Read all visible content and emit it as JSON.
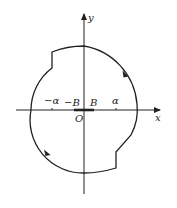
{
  "diagram": {
    "type": "contour-plot",
    "axes": {
      "x_label": "x",
      "y_label": "y",
      "origin_label": "O"
    },
    "tick_labels": {
      "neg_alpha": "−α",
      "neg_B": "−B",
      "pos_B": "B",
      "pos_alpha": "α"
    },
    "contour": {
      "shape": "closed circular contour with two step notches",
      "direction": "clockwise",
      "notches": [
        "top-left step at x = −α",
        "bottom-right step at x = α"
      ]
    },
    "segment": {
      "description": "thick segment on x-axis from −B to B"
    },
    "colors": {
      "stroke": "#222222",
      "background": "#ffffff"
    }
  }
}
